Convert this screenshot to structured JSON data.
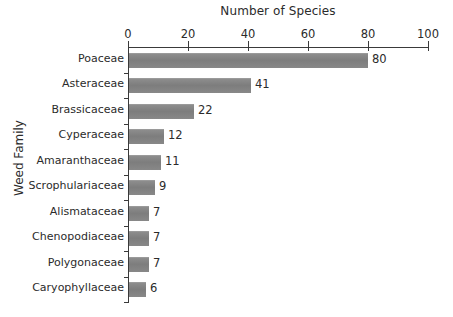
{
  "chart_data": {
    "type": "bar",
    "orientation": "horizontal",
    "title": "Number of Species",
    "xlabel": "Number of Species",
    "ylabel": "Weed Family",
    "categories": [
      "Poaceae",
      "Asteraceae",
      "Brassicaceae",
      "Cyperaceae",
      "Amaranthaceae",
      "Scrophulariaceae",
      "Alismataceae",
      "Chenopodiaceae",
      "Polygonaceae",
      "Caryophyllaceae"
    ],
    "values": [
      80,
      41,
      22,
      12,
      11,
      9,
      7,
      7,
      7,
      6
    ],
    "value_labels": [
      "80",
      "41",
      "22",
      "12",
      "11",
      "9",
      "7",
      "7",
      "7",
      "6"
    ],
    "xlim": [
      0,
      100
    ],
    "xticks": [
      0,
      20,
      40,
      60,
      80,
      100
    ],
    "xtick_labels": [
      "0",
      "20",
      "40",
      "60",
      "80",
      "100"
    ],
    "grid": false,
    "legend": false,
    "bar_color": "#808080",
    "axis_color": "#3a3a3a",
    "text_color": "#2b2b2b"
  }
}
